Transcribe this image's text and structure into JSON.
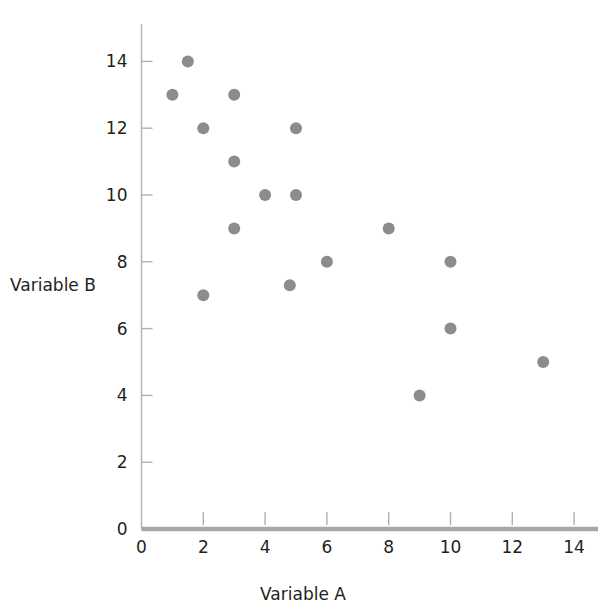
{
  "chart_data": {
    "type": "scatter",
    "title": "",
    "xlabel": "Variable A",
    "ylabel": "Variable B",
    "xlim": [
      0,
      14.7
    ],
    "ylim": [
      0,
      14.8
    ],
    "xticks": [
      0,
      2,
      4,
      6,
      8,
      10,
      12,
      14
    ],
    "yticks": [
      0,
      2,
      4,
      6,
      8,
      10,
      12,
      14
    ],
    "xtick_labels": [
      "0",
      "2",
      "4",
      "6",
      "8",
      "10",
      "12",
      "14"
    ],
    "ytick_labels": [
      "0",
      "2",
      "4",
      "6",
      "8",
      "10",
      "12",
      "14"
    ],
    "grid": false,
    "legend": null,
    "marker_color": "#8c8c8c",
    "marker_radius": 6,
    "points": [
      {
        "x": 1.0,
        "y": 13.0
      },
      {
        "x": 1.5,
        "y": 14.0
      },
      {
        "x": 2.0,
        "y": 12.0
      },
      {
        "x": 2.0,
        "y": 7.0
      },
      {
        "x": 3.0,
        "y": 13.0
      },
      {
        "x": 3.0,
        "y": 11.0
      },
      {
        "x": 3.0,
        "y": 9.0
      },
      {
        "x": 4.0,
        "y": 10.0
      },
      {
        "x": 5.0,
        "y": 12.0
      },
      {
        "x": 5.0,
        "y": 10.0
      },
      {
        "x": 4.8,
        "y": 7.3
      },
      {
        "x": 6.0,
        "y": 8.0
      },
      {
        "x": 8.0,
        "y": 9.0
      },
      {
        "x": 9.0,
        "y": 4.0
      },
      {
        "x": 10.0,
        "y": 8.0
      },
      {
        "x": 10.0,
        "y": 6.0
      },
      {
        "x": 13.0,
        "y": 5.0
      }
    ]
  },
  "axes": {
    "x_title": "Variable A",
    "y_title": "Variable B"
  }
}
